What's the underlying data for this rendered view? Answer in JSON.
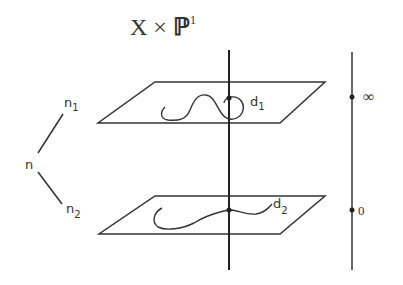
{
  "title": {
    "base": "X × ",
    "space": "ℙ",
    "exponent": "1"
  },
  "tree": {
    "root": "n",
    "child_1": {
      "base": "n",
      "sub": "1"
    },
    "child_2": {
      "base": "n",
      "sub": "2"
    }
  },
  "planes": [
    {
      "curve_label": {
        "base": "d",
        "sub": "1"
      }
    },
    {
      "curve_label": {
        "base": "d",
        "sub": "2"
      }
    }
  ],
  "projective_line": {
    "points": [
      {
        "label": "∞"
      },
      {
        "label": "0"
      }
    ]
  },
  "colors": {
    "ink": "#333333",
    "background": "#ffffff"
  }
}
